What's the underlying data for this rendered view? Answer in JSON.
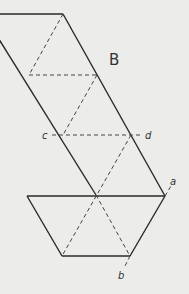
{
  "figure": {
    "region_label": "B",
    "point_labels": {
      "a": "a",
      "b": "b",
      "c": "c",
      "d": "d"
    },
    "colors": {
      "background": "#ececeb",
      "line": "#2a2a2a",
      "dashed": "#444444",
      "text": "#333333"
    },
    "solid_lines": [
      {
        "x1": 0,
        "y1": 14,
        "x2": 63,
        "y2": 14
      },
      {
        "x1": -8,
        "y1": 28,
        "x2": 96,
        "y2": 195
      },
      {
        "x1": 63,
        "y1": 14,
        "x2": 165,
        "y2": 195
      },
      {
        "x1": 27,
        "y1": 196,
        "x2": 165,
        "y2": 196
      },
      {
        "x1": 27,
        "y1": 196,
        "x2": 62,
        "y2": 256
      },
      {
        "x1": 62,
        "y1": 256,
        "x2": 130,
        "y2": 256
      },
      {
        "x1": 130,
        "y1": 256,
        "x2": 165,
        "y2": 196
      }
    ],
    "dashed_lines": [
      {
        "x1": 63,
        "y1": 14,
        "x2": 29,
        "y2": 75
      },
      {
        "x1": 29,
        "y1": 75,
        "x2": 97,
        "y2": 75
      },
      {
        "x1": 97,
        "y1": 75,
        "x2": 63,
        "y2": 135
      },
      {
        "x1": 52,
        "y1": 135,
        "x2": 142,
        "y2": 135
      },
      {
        "x1": 131,
        "y1": 135,
        "x2": 62,
        "y2": 256
      },
      {
        "x1": 96,
        "y1": 195,
        "x2": 130,
        "y2": 256
      },
      {
        "x1": 130,
        "y1": 256,
        "x2": 124,
        "y2": 268
      },
      {
        "x1": 165,
        "y1": 196,
        "x2": 171,
        "y2": 186
      }
    ]
  }
}
